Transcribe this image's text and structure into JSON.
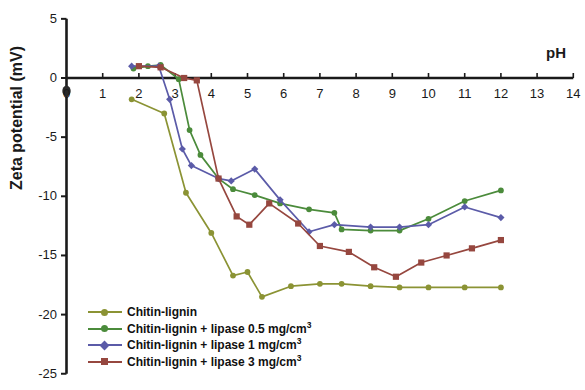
{
  "chart_data": {
    "type": "line",
    "title": "",
    "xlabel": "pH",
    "ylabel": "Zeta potential (mV)",
    "xlim": [
      0,
      14
    ],
    "ylim": [
      -25,
      5
    ],
    "xticks": [
      0,
      1,
      2,
      3,
      4,
      5,
      6,
      7,
      8,
      9,
      10,
      11,
      12,
      13,
      14
    ],
    "xtick_labels": [
      "0",
      "1",
      "2",
      "3",
      "4",
      "5",
      "6",
      "7",
      "8",
      "9",
      "10",
      "11",
      "12",
      "13",
      "14"
    ],
    "yticks": [
      5,
      0,
      -5,
      -10,
      -15,
      -20,
      -25
    ],
    "ytick_labels": [
      "5",
      "0",
      "-5",
      "-10",
      "-15",
      "-20",
      "-25"
    ],
    "grid": false,
    "legend_position": "lower-left-inside",
    "series": [
      {
        "name": "Chitin-lignin",
        "color": "#8b9334",
        "marker": "circle",
        "points": [
          [
            1.8,
            -1.8
          ],
          [
            2.7,
            -3.0
          ],
          [
            3.3,
            -9.7
          ],
          [
            4.0,
            -13.1
          ],
          [
            4.6,
            -16.7
          ],
          [
            5.0,
            -16.4
          ],
          [
            5.4,
            -18.5
          ],
          [
            6.2,
            -17.6
          ],
          [
            7.0,
            -17.4
          ],
          [
            7.6,
            -17.4
          ],
          [
            8.4,
            -17.6
          ],
          [
            9.2,
            -17.7
          ],
          [
            10.0,
            -17.7
          ],
          [
            11.0,
            -17.7
          ],
          [
            12.0,
            -17.7
          ]
        ]
      },
      {
        "name": "Chitin-lignin + lipase 0.5 mg/cm3",
        "label_main": "Chitin-lignin + lipase 0.5 mg/cm",
        "label_sup": "3",
        "color": "#4b8b3b",
        "marker": "circle",
        "points": [
          [
            1.85,
            0.8
          ],
          [
            2.25,
            1.0
          ],
          [
            2.6,
            1.1
          ],
          [
            3.1,
            -0.1
          ],
          [
            3.4,
            -4.4
          ],
          [
            3.7,
            -6.5
          ],
          [
            4.2,
            -8.5
          ],
          [
            4.6,
            -9.4
          ],
          [
            5.2,
            -9.9
          ],
          [
            5.9,
            -10.6
          ],
          [
            6.7,
            -11.1
          ],
          [
            7.4,
            -11.4
          ],
          [
            7.6,
            -12.8
          ],
          [
            8.4,
            -12.9
          ],
          [
            9.2,
            -12.9
          ],
          [
            10.0,
            -11.9
          ],
          [
            11.0,
            -10.4
          ],
          [
            12.0,
            -9.5
          ]
        ]
      },
      {
        "name": "Chitin-lignin + lipase 1 mg/cm3",
        "label_main": "Chitin-lignin + lipase 1 mg/cm",
        "label_sup": "3",
        "color": "#5b5ba8",
        "marker": "diamond",
        "points": [
          [
            1.8,
            1.0
          ],
          [
            2.55,
            1.0
          ],
          [
            2.85,
            -1.8
          ],
          [
            3.2,
            -6.0
          ],
          [
            3.45,
            -7.4
          ],
          [
            4.2,
            -8.5
          ],
          [
            4.55,
            -8.7
          ],
          [
            5.2,
            -7.7
          ],
          [
            5.9,
            -10.3
          ],
          [
            6.7,
            -13.0
          ],
          [
            7.4,
            -12.4
          ],
          [
            8.4,
            -12.6
          ],
          [
            9.2,
            -12.6
          ],
          [
            10.0,
            -12.4
          ],
          [
            11.0,
            -10.9
          ],
          [
            12.0,
            -11.8
          ]
        ]
      },
      {
        "name": "Chitin-lignin + lipase 3 mg/cm3",
        "label_main": "Chitin-lignin + lipase 3 mg/cm",
        "label_sup": "3",
        "color": "#96473f",
        "marker": "square",
        "points": [
          [
            2.0,
            1.0
          ],
          [
            2.6,
            0.9
          ],
          [
            3.25,
            0.0
          ],
          [
            3.6,
            -0.2
          ],
          [
            4.2,
            -8.5
          ],
          [
            4.7,
            -11.7
          ],
          [
            5.05,
            -12.4
          ],
          [
            5.6,
            -10.6
          ],
          [
            6.4,
            -12.3
          ],
          [
            7.0,
            -14.2
          ],
          [
            7.8,
            -14.7
          ],
          [
            8.5,
            -16.0
          ],
          [
            9.1,
            -16.8
          ],
          [
            9.8,
            -15.6
          ],
          [
            10.5,
            -15.0
          ],
          [
            11.2,
            -14.4
          ],
          [
            12.0,
            -13.7
          ]
        ]
      }
    ]
  },
  "axis": {
    "x_title": "pH",
    "y_title": "Zeta potential (mV)"
  }
}
